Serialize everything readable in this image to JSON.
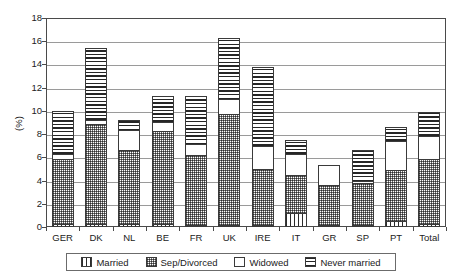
{
  "chart_data": {
    "type": "bar",
    "subtype": "stacked-vertical",
    "title": "",
    "xlabel": "",
    "ylabel": "(%)",
    "ylim": [
      0,
      18
    ],
    "ytick_step": 2,
    "yticks": [
      "18",
      "16",
      "14",
      "12",
      "10",
      "8",
      "6",
      "4",
      "2",
      "0"
    ],
    "grid": "horizontal",
    "legend_position": "bottom",
    "categories": [
      "GER",
      "DK",
      "NL",
      "BE",
      "FR",
      "UK",
      "IRE",
      "IT",
      "GR",
      "SP",
      "PT",
      "Total"
    ],
    "series": [
      {
        "name": "Married",
        "pattern": "vertical-lines",
        "values": [
          0.25,
          0.25,
          0.25,
          0.25,
          0.2,
          0.2,
          0.2,
          1.2,
          0.15,
          0.2,
          0.5,
          0.3
        ]
      },
      {
        "name": "Sep/Divorced",
        "pattern": "checkered",
        "values": [
          5.6,
          8.6,
          6.4,
          8.05,
          6.0,
          9.5,
          4.8,
          3.3,
          3.45,
          3.6,
          4.4,
          5.6
        ]
      },
      {
        "name": "Widowed",
        "pattern": "white",
        "values": [
          0.45,
          0.35,
          1.7,
          0.75,
          0.95,
          1.3,
          2.0,
          1.8,
          1.7,
          0.2,
          2.5,
          1.9
        ]
      },
      {
        "name": "Never married",
        "pattern": "horizontal-lines",
        "values": [
          3.7,
          6.2,
          0.9,
          2.25,
          4.15,
          5.25,
          6.8,
          1.2,
          0.0,
          2.65,
          1.2,
          2.1
        ]
      }
    ],
    "totals": [
      10.0,
      15.4,
      9.25,
      11.3,
      11.3,
      16.25,
      13.8,
      7.5,
      5.3,
      6.65,
      8.6,
      9.9
    ]
  },
  "legend": {
    "items": [
      {
        "label": "Married"
      },
      {
        "label": "Sep/Divorced"
      },
      {
        "label": "Widowed"
      },
      {
        "label": "Never married"
      }
    ]
  }
}
